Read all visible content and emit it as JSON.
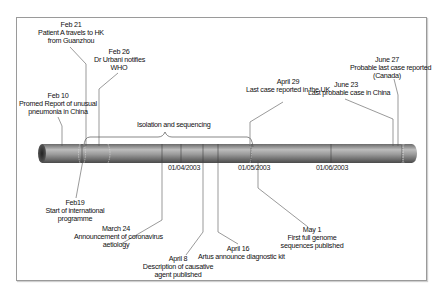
{
  "diagram": {
    "type": "timeline",
    "axis_ticks": [
      {
        "label": "01/04/2003",
        "x": 181
      },
      {
        "label": "01/05/2003",
        "x": 251
      },
      {
        "label": "01/06/2003",
        "x": 331
      }
    ],
    "bracket": {
      "label": "Isolation and sequencing"
    },
    "events_above": [
      {
        "date": "Feb 10",
        "text": "Promed Report of unusual\npneumonia in China"
      },
      {
        "date": "Feb 21",
        "text": "Patient A travels to HK\nfrom Guanzhou"
      },
      {
        "date": "Feb 26",
        "text": "Dr Urbani notifies\nWHO"
      },
      {
        "date": "April 29",
        "text": "Last case reported in the UK"
      },
      {
        "date": "June 23",
        "text": "Last probable case in China"
      },
      {
        "date": "June 27",
        "text": "Probable last case reported\n(Canada)"
      }
    ],
    "events_below": [
      {
        "date": "Feb19",
        "text": "Start of international\nprogramme"
      },
      {
        "date": "March 24",
        "text": "Announcement of coronavirus\naetiology"
      },
      {
        "date": "April 8",
        "text": "Description of causative\nagent published"
      },
      {
        "date": "April 16",
        "text": "Artus announce diagnostic kit"
      },
      {
        "date": "May 1",
        "text": "First full genome\nsequences published"
      }
    ],
    "colors": {
      "tube_dark": "#555555",
      "tube_light": "#bdbdbd",
      "line": "#555555",
      "frame": "#9a9a9a"
    }
  }
}
